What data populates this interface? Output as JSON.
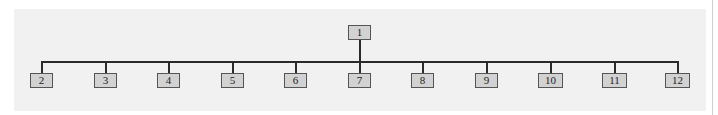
{
  "diagram": {
    "type": "tree",
    "root": {
      "id": "1",
      "label": "1"
    },
    "children": [
      {
        "id": "2",
        "label": "2"
      },
      {
        "id": "3",
        "label": "3"
      },
      {
        "id": "4",
        "label": "4"
      },
      {
        "id": "5",
        "label": "5"
      },
      {
        "id": "6",
        "label": "6"
      },
      {
        "id": "7",
        "label": "7"
      },
      {
        "id": "8",
        "label": "8"
      },
      {
        "id": "9",
        "label": "9"
      },
      {
        "id": "10",
        "label": "10"
      },
      {
        "id": "11",
        "label": "11"
      },
      {
        "id": "12",
        "label": "12"
      }
    ],
    "colors": {
      "node_fill": "#d2d2d2",
      "node_border": "#555555",
      "line": "#2a2a2a",
      "background": "#f1f1f1"
    }
  }
}
